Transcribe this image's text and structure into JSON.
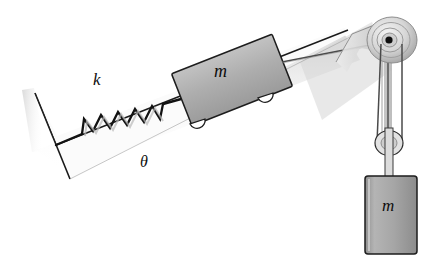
{
  "figure": {
    "type": "physics-free-body-diagram",
    "background": "#ffffff"
  },
  "labels": {
    "spring_constant": "k",
    "incline_angle": "θ",
    "block_mass": "m",
    "hanging_mass": "m"
  },
  "colors": {
    "outline": "#1a1a1a",
    "block_fill": "#a9a9a9",
    "block_fill_light": "#bdbdbd",
    "hanging_fill": "#a8a8a8",
    "incline_fill": "#f2f2f2",
    "shadow": "#c9c9c9",
    "pulley_fill": "#d0d0d0",
    "rope": "#3a3a3a",
    "white": "#ffffff"
  },
  "components": [
    {
      "name": "vertical-wall",
      "description": "Vertical wall at left end of wedge anchoring the spring"
    },
    {
      "name": "incline-surface",
      "description": "Inclined ramp surface rising to the right"
    },
    {
      "name": "spring",
      "description": "Coil spring labelled k connecting wall to block",
      "coils": 7
    },
    {
      "name": "block-on-incline",
      "description": "Rectangular block of mass m with two wheels resting on the incline"
    },
    {
      "name": "wheel",
      "count": 2,
      "description": "Small wheels under the block"
    },
    {
      "name": "rope-block-to-pulley",
      "description": "Rope from block running up the incline to the fixed pulley"
    },
    {
      "name": "support-column",
      "description": "Vertical support post holding the fixed pulley"
    },
    {
      "name": "fixed-pulley",
      "description": "Fixed pulley at top of support column with concentric grooves and dark hub"
    },
    {
      "name": "movable-pulley",
      "description": "Lower movable pulley carried by the hanging mass"
    },
    {
      "name": "hanging-mass",
      "description": "Suspended block of mass m hanging from the movable pulley"
    },
    {
      "name": "angle-marker",
      "description": "Incline angle theta measured at the base"
    }
  ],
  "geometry": {
    "incline_angle_deg": 22,
    "canvas": {
      "width": 446,
      "height": 265
    }
  }
}
